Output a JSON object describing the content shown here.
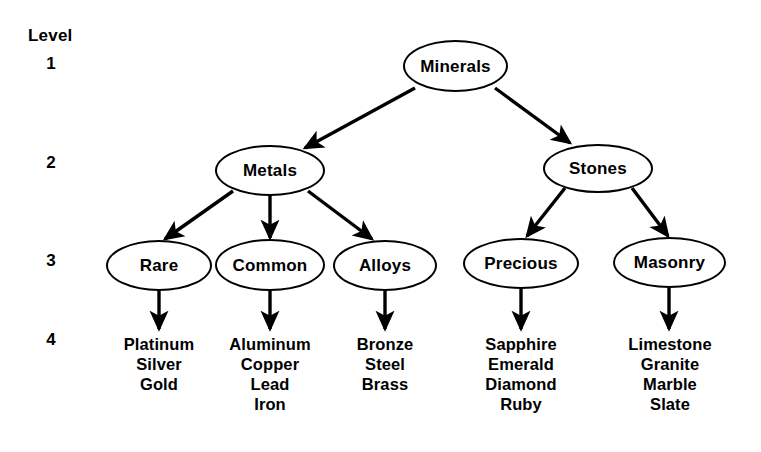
{
  "diagram": {
    "title_gutter": "Level",
    "levels": [
      {
        "label": "1"
      },
      {
        "label": "2"
      },
      {
        "label": "3"
      },
      {
        "label": "4"
      }
    ],
    "nodes": {
      "root": "Minerals",
      "metals": "Metals",
      "stones": "Stones",
      "rare": "Rare",
      "common": "Common",
      "alloys": "Alloys",
      "precious": "Precious",
      "masonry": "Masonry"
    },
    "leaves": {
      "rare": [
        "Platinum",
        "Silver",
        "Gold"
      ],
      "common": [
        "Aluminum",
        "Copper",
        "Lead",
        "Iron"
      ],
      "alloys": [
        "Bronze",
        "Steel",
        "Brass"
      ],
      "precious": [
        "Sapphire",
        "Emerald",
        "Diamond",
        "Ruby"
      ],
      "masonry": [
        "Limestone",
        "Granite",
        "Marble",
        "Slate"
      ]
    },
    "colors": {
      "stroke": "#000000",
      "background": "#ffffff",
      "text": "#000000"
    }
  }
}
